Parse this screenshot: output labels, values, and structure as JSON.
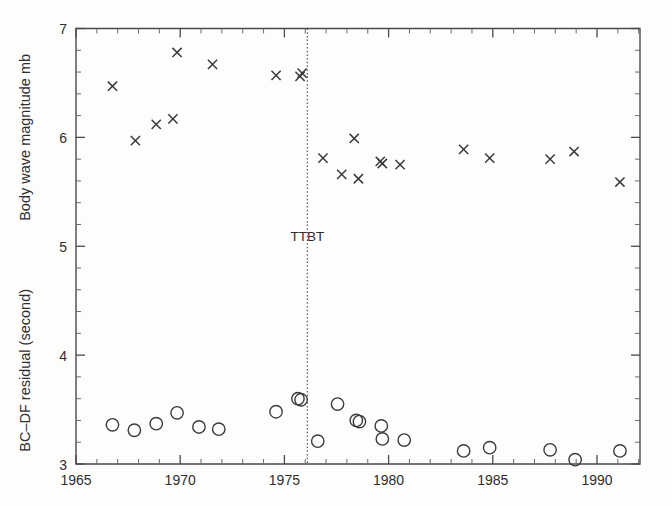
{
  "chart_data": {
    "type": "scatter",
    "title": "",
    "xlabel": "",
    "ylabel_upper": "Body wave magnitude mb",
    "ylabel_lower": "BC–DF residual (second)",
    "xlim": [
      1965,
      1992
    ],
    "ylim": [
      3,
      7
    ],
    "x_ticks_major": [
      1965,
      1970,
      1975,
      1980,
      1985,
      1990
    ],
    "x_tick_labels": [
      "1965",
      "1970",
      "1975",
      "1980",
      "1985",
      "1990"
    ],
    "x_tick_minor_step": 1,
    "y_ticks_major": [
      3,
      4,
      5,
      6,
      7
    ],
    "y_tick_labels": [
      "3",
      "4",
      "5",
      "6",
      "7"
    ],
    "y_tick_minor_step": 0.2,
    "grid": false,
    "legend": null,
    "annotations": [
      {
        "name": "TTBT",
        "label": "TTBT",
        "type": "vertical-line",
        "x": 1976.1,
        "label_y": 5.05,
        "style": "dotted"
      }
    ],
    "series": [
      {
        "name": "Body wave magnitude mb",
        "marker": "cross",
        "axis": "upper",
        "points": [
          {
            "x": 1966.75,
            "y": 6.47
          },
          {
            "x": 1967.85,
            "y": 5.97
          },
          {
            "x": 1968.85,
            "y": 6.12
          },
          {
            "x": 1969.85,
            "y": 6.78
          },
          {
            "x": 1969.65,
            "y": 6.17
          },
          {
            "x": 1971.55,
            "y": 6.67
          },
          {
            "x": 1974.6,
            "y": 6.57
          },
          {
            "x": 1975.75,
            "y": 6.56
          },
          {
            "x": 1975.85,
            "y": 6.59
          },
          {
            "x": 1976.85,
            "y": 5.81
          },
          {
            "x": 1977.75,
            "y": 5.66
          },
          {
            "x": 1978.35,
            "y": 5.99
          },
          {
            "x": 1978.55,
            "y": 5.62
          },
          {
            "x": 1979.6,
            "y": 5.78
          },
          {
            "x": 1979.7,
            "y": 5.76
          },
          {
            "x": 1980.55,
            "y": 5.75
          },
          {
            "x": 1983.6,
            "y": 5.89
          },
          {
            "x": 1984.85,
            "y": 5.81
          },
          {
            "x": 1987.75,
            "y": 5.8
          },
          {
            "x": 1988.9,
            "y": 5.87
          },
          {
            "x": 1991.1,
            "y": 5.59
          }
        ]
      },
      {
        "name": "BC–DF residual (second)",
        "marker": "circle",
        "axis": "lower",
        "points": [
          {
            "x": 1966.75,
            "y": 3.36
          },
          {
            "x": 1967.8,
            "y": 3.31
          },
          {
            "x": 1968.85,
            "y": 3.37
          },
          {
            "x": 1969.85,
            "y": 3.47
          },
          {
            "x": 1970.9,
            "y": 3.34
          },
          {
            "x": 1971.85,
            "y": 3.32
          },
          {
            "x": 1974.6,
            "y": 3.48
          },
          {
            "x": 1975.65,
            "y": 3.6
          },
          {
            "x": 1975.8,
            "y": 3.59
          },
          {
            "x": 1976.6,
            "y": 3.21
          },
          {
            "x": 1977.55,
            "y": 3.55
          },
          {
            "x": 1978.45,
            "y": 3.4
          },
          {
            "x": 1978.6,
            "y": 3.39
          },
          {
            "x": 1979.65,
            "y": 3.35
          },
          {
            "x": 1979.7,
            "y": 3.23
          },
          {
            "x": 1980.75,
            "y": 3.22
          },
          {
            "x": 1983.6,
            "y": 3.12
          },
          {
            "x": 1984.85,
            "y": 3.15
          },
          {
            "x": 1987.75,
            "y": 3.13
          },
          {
            "x": 1988.95,
            "y": 3.04
          },
          {
            "x": 1991.1,
            "y": 3.12
          }
        ]
      }
    ]
  },
  "axis_titles": {
    "upper": "Body wave magnitude mb",
    "lower": "BC–DF residual (second)"
  },
  "colors": {
    "marker": "#3a3a3a",
    "axis": "#4a4a4a",
    "text": "#2e2e2e",
    "background": "#fdfdfc"
  }
}
